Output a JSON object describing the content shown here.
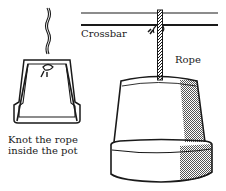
{
  "labels": {
    "crossbar": "Crossbar",
    "rope": "Rope",
    "knot_line1": "Knot the rope",
    "knot_line2": "inside the pot"
  },
  "colors": {
    "ink": "#1a1a1a",
    "shade": "#8a8a8a",
    "background": "#ffffff"
  }
}
